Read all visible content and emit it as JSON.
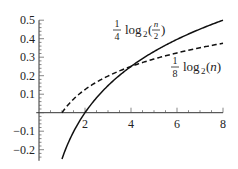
{
  "chart_data": {
    "type": "line",
    "title": "",
    "xlabel": "",
    "ylabel": "",
    "xlim": [
      0,
      8
    ],
    "ylim": [
      -0.25,
      0.5
    ],
    "grid": false,
    "legend_position": "inline labels",
    "x_ticks": [
      2,
      4,
      6,
      8
    ],
    "x_tick_labels": [
      "2",
      "4",
      "6",
      "8"
    ],
    "y_ticks": [
      -0.2,
      -0.1,
      0.1,
      0.2,
      0.3,
      0.4,
      0.5
    ],
    "y_tick_labels": [
      "−0.2",
      "−0.1",
      "0.1",
      "0.2",
      "0.3",
      "0.4",
      "0.5"
    ],
    "series": [
      {
        "name": "1/4 log2(n/2)",
        "style": "solid",
        "x": [
          1,
          1.5,
          2,
          2.5,
          3,
          4,
          5,
          6,
          7,
          8
        ],
        "values": [
          -0.25,
          -0.104,
          0,
          0.08,
          0.146,
          0.25,
          0.33,
          0.396,
          0.452,
          0.5
        ]
      },
      {
        "name": "1/8 log2(n)",
        "style": "dashed",
        "x": [
          1,
          1.5,
          2,
          2.5,
          3,
          4,
          5,
          6,
          7,
          8
        ],
        "values": [
          0,
          0.073,
          0.125,
          0.165,
          0.198,
          0.25,
          0.29,
          0.323,
          0.351,
          0.375
        ]
      }
    ],
    "annotations": [
      {
        "text_frac": "1/4",
        "text_fn": "log",
        "sub": "2",
        "arg_num": "n",
        "arg_den": "2",
        "near_x": 4,
        "near_y": 0.45
      },
      {
        "text_frac": "1/8",
        "text_fn": "log",
        "sub": "2",
        "arg": "(n)",
        "near_x": 6.5,
        "near_y": 0.25
      }
    ],
    "intersection": {
      "x": 4,
      "y": 0.25
    }
  },
  "labels": {
    "solid": {
      "num": "1",
      "den": "4",
      "fn": "log",
      "sub": "2",
      "open": "(",
      "frac_num": "n",
      "frac_den": "2",
      "close": ")"
    },
    "dashed": {
      "num": "1",
      "den": "8",
      "fn": "log",
      "sub": "2",
      "arg": "(n)"
    }
  }
}
